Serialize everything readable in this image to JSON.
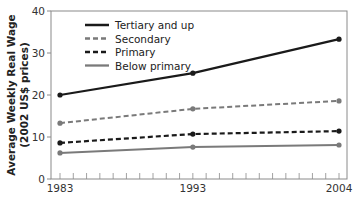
{
  "chart_data": {
    "type": "line",
    "title": "",
    "xlabel": "",
    "ylabel": "Average Weekly Real Wage (2002 US$ prices)",
    "ylabel_lines": [
      "Average Weekly Real Wage",
      "(2002 US$ prices)"
    ],
    "x": [
      1983,
      1993,
      2004
    ],
    "x_tick_labels": [
      "1983",
      "1993",
      "2004"
    ],
    "y_ticks": [
      0,
      10,
      20,
      30,
      40
    ],
    "y_tick_labels": [
      "0",
      "10",
      "20",
      "30",
      "40"
    ],
    "ylim": [
      0,
      40
    ],
    "xlim": [
      1982.3,
      2004.6
    ],
    "grid": false,
    "legend_position": "upper-left-inside",
    "series": [
      {
        "name": "Tertiary and up",
        "values": [
          20.0,
          25.2,
          33.3
        ],
        "color": "#1a1a1a",
        "dash": "solid",
        "width": 2.2
      },
      {
        "name": "Secondary",
        "values": [
          13.3,
          16.7,
          18.6
        ],
        "color": "#7a7a7a",
        "dash": "dashed",
        "width": 2.0
      },
      {
        "name": "Primary",
        "values": [
          8.6,
          10.7,
          11.4
        ],
        "color": "#1a1a1a",
        "dash": "dashed",
        "width": 2.2
      },
      {
        "name": "Below primary",
        "values": [
          6.2,
          7.6,
          8.1
        ],
        "color": "#7a7a7a",
        "dash": "solid",
        "width": 2.0
      }
    ]
  }
}
